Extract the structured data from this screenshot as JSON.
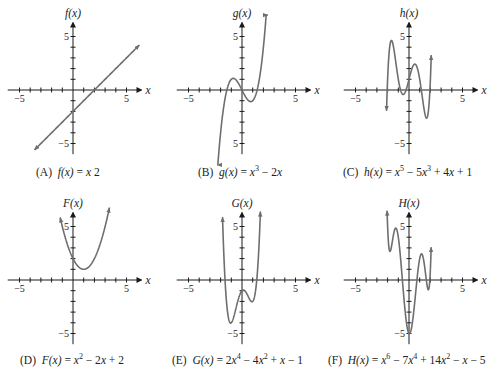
{
  "chart_data": [
    {
      "type": "line",
      "panel": "A",
      "caption_label": "(A)",
      "caption_fn": "f(x)",
      "caption_expr": [
        [
          "x",
          ""
        ],
        [
          " ",
          ""
        ],
        [
          "2",
          ""
        ]
      ],
      "y_label": "f(x)",
      "x_label": "x",
      "xlim": [
        -5,
        5
      ],
      "ylim": [
        -5,
        5
      ],
      "tick_labels": {
        "x": [
          "−5",
          "5"
        ],
        "y": [
          "5",
          "−5"
        ]
      },
      "coeffs": [
        -2,
        1
      ],
      "domain": [
        -3.6,
        6.2
      ],
      "arrows": "both",
      "origin_px": [
        73,
        90
      ],
      "caption_px": [
        36,
        174
      ]
    },
    {
      "type": "line",
      "panel": "B",
      "caption_label": "(B)",
      "caption_fn": "g(x)",
      "caption_expr": [
        [
          "x",
          "3"
        ],
        [
          " − 2",
          ""
        ],
        [
          "x",
          ""
        ]
      ],
      "y_label": "g(x)",
      "x_label": "x",
      "xlim": [
        -5,
        5
      ],
      "ylim": [
        -5,
        5
      ],
      "tick_labels": {
        "x": [
          "−5",
          "5"
        ],
        "y": [
          "5",
          "5"
        ]
      },
      "coeffs": [
        0,
        -2,
        0,
        1
      ],
      "domain": [
        -2.3,
        2.4
      ],
      "arrows": "both",
      "origin_px": [
        242,
        90
      ],
      "caption_px": [
        198,
        174
      ]
    },
    {
      "type": "line",
      "panel": "C",
      "caption_label": "(C)",
      "caption_fn": "h(x)",
      "caption_expr": [
        [
          "x",
          "5"
        ],
        [
          " − 5",
          ""
        ],
        [
          "x",
          "3"
        ],
        [
          " + 4",
          ""
        ],
        [
          "x",
          ""
        ],
        [
          " + 1",
          ""
        ]
      ],
      "y_label": "h(x)",
      "x_label": "x",
      "xlim": [
        -5,
        5
      ],
      "ylim": [
        -5,
        5
      ],
      "tick_labels": {
        "x": [
          "−5",
          "5"
        ],
        "y": [
          "5",
          "−5"
        ]
      },
      "coeffs": [
        1,
        4,
        0,
        -5,
        0,
        1
      ],
      "domain": [
        -2.1,
        2.08
      ],
      "arrows": "both",
      "origin_px": [
        409,
        90
      ],
      "caption_px": [
        343,
        174
      ]
    },
    {
      "type": "line",
      "panel": "D",
      "caption_label": "(D)",
      "caption_fn": "F(x)",
      "caption_expr": [
        [
          "x",
          "2"
        ],
        [
          " − 2",
          ""
        ],
        [
          "x",
          ""
        ],
        [
          " + 2",
          ""
        ]
      ],
      "y_label": "F(x)",
      "x_label": "x",
      "xlim": [
        -5,
        5
      ],
      "ylim": [
        -5,
        5
      ],
      "tick_labels": {
        "x": [
          "−5",
          "5"
        ],
        "y": [
          "5",
          "−5"
        ]
      },
      "coeffs": [
        2,
        -2,
        1
      ],
      "domain": [
        -1.2,
        3.4
      ],
      "arrows": "both",
      "origin_px": [
        73,
        280
      ],
      "caption_px": [
        20,
        362
      ]
    },
    {
      "type": "line",
      "panel": "E",
      "caption_label": "(E)",
      "caption_fn": "G(x)",
      "caption_expr": [
        [
          "2x",
          "4"
        ],
        [
          " − 4",
          ""
        ],
        [
          "x",
          "2"
        ],
        [
          " + ",
          ""
        ],
        [
          "x",
          ""
        ],
        [
          " − 1",
          ""
        ]
      ],
      "y_label": "G(x)",
      "x_label": "x",
      "xlim": [
        -5,
        5
      ],
      "ylim": [
        -5,
        5
      ],
      "tick_labels": {
        "x": [
          "−5",
          "5"
        ],
        "y": [
          "5",
          "−5"
        ]
      },
      "coeffs": [
        -1,
        1,
        -4,
        0,
        2
      ],
      "domain": [
        -1.82,
        1.72
      ],
      "arrows": "both",
      "origin_px": [
        242,
        280
      ],
      "caption_px": [
        172,
        362
      ]
    },
    {
      "type": "line",
      "panel": "F",
      "caption_label": "(F)",
      "caption_fn": "H(x)",
      "caption_expr": [
        [
          "x",
          "6"
        ],
        [
          " − 7",
          ""
        ],
        [
          "x",
          "4"
        ],
        [
          " + 14",
          ""
        ],
        [
          "x",
          "2"
        ],
        [
          " − ",
          ""
        ],
        [
          "x",
          ""
        ],
        [
          " − 5",
          ""
        ]
      ],
      "y_label": "H(x)",
      "x_label": "x",
      "xlim": [
        -5,
        5
      ],
      "ylim": [
        -5,
        5
      ],
      "tick_labels": {
        "x": [
          "−5",
          "5"
        ],
        "y": [
          "5",
          "−5"
        ]
      },
      "coeffs": [
        -5,
        -1,
        14,
        0,
        -7,
        0,
        1
      ],
      "domain": [
        -2.05,
        2.07
      ],
      "arrows": "both",
      "origin_px": [
        409,
        280
      ],
      "caption_px": [
        328,
        362
      ]
    }
  ],
  "style": {
    "axis_color": "#1a1a1a",
    "curve_color": "#6e6e6e",
    "unit_px": 10.7
  }
}
